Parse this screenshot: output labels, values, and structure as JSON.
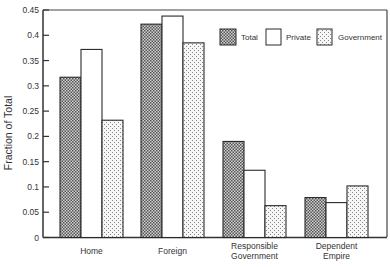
{
  "chart_data": {
    "type": "bar",
    "title": "",
    "xlabel": "",
    "ylabel": "Fraction of Total",
    "ylim": [
      0,
      0.45
    ],
    "yticks": [
      0,
      0.05,
      0.1,
      0.15,
      0.2,
      0.25,
      0.3,
      0.35,
      0.4,
      0.45
    ],
    "ytick_labels": [
      "0",
      "0.05",
      "0.1",
      "0.15",
      "0.2",
      "0.25",
      "0.3",
      "0.35",
      "0.4",
      "0.45"
    ],
    "grid": false,
    "legend_position": "upper right (inside)",
    "categories": [
      [
        "Home"
      ],
      [
        "Foreign"
      ],
      [
        "Responsible",
        "Government"
      ],
      [
        "Dependent",
        "Empire"
      ]
    ],
    "series": [
      {
        "name": "Total",
        "pattern": "crosshatch",
        "values": [
          0.317,
          0.422,
          0.19,
          0.079
        ]
      },
      {
        "name": "Private",
        "pattern": "none",
        "values": [
          0.372,
          0.438,
          0.133,
          0.069
        ]
      },
      {
        "name": "Government",
        "pattern": "dots",
        "values": [
          0.232,
          0.385,
          0.063,
          0.102
        ]
      }
    ]
  },
  "colors": {
    "axis": "#333333",
    "hatch_dark": "#5a5a5a",
    "hatch_light": "#d9d9d9",
    "dots": "#8a8a8a",
    "bar_outline": "#2a2a2a"
  }
}
